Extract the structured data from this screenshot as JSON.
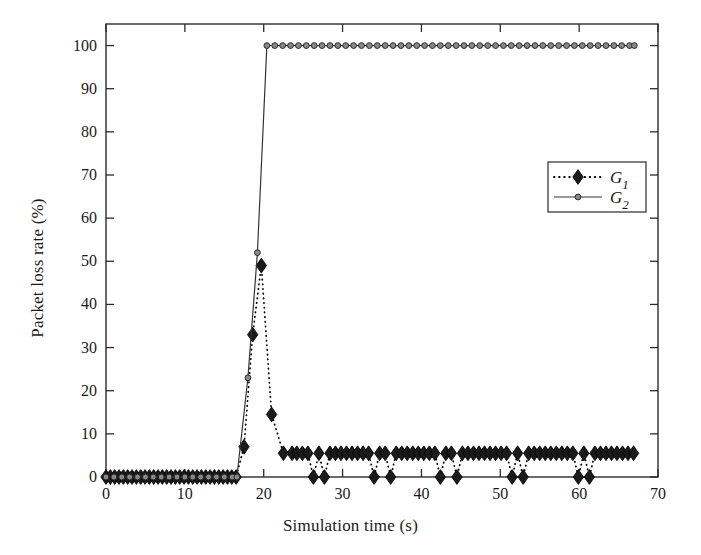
{
  "chart_data": {
    "type": "line",
    "title": "",
    "xlabel": "Simulation time (s)",
    "ylabel": "Packet loss rate (%)",
    "xlim": [
      0,
      70
    ],
    "ylim": [
      0,
      105
    ],
    "xticks": [
      0,
      10,
      20,
      30,
      40,
      50,
      60,
      70
    ],
    "yticks": [
      0,
      10,
      20,
      30,
      40,
      50,
      60,
      70,
      80,
      90,
      100
    ],
    "xtick_labels": [
      "0",
      "10",
      "20",
      "30",
      "40",
      "50",
      "60",
      "70"
    ],
    "ytick_labels": [
      "0",
      "10",
      "20",
      "30",
      "40",
      "50",
      "60",
      "70",
      "80",
      "90",
      "100"
    ],
    "grid": false,
    "legend_position": "upper right",
    "series": [
      {
        "name": "G1",
        "label": "G",
        "subscript": "1",
        "color": "#000000",
        "linestyle": "dotted",
        "marker": "diamond",
        "marker_fill": "#1a1a1a",
        "x": [
          0,
          0.55,
          1.1,
          1.65,
          2.2,
          2.75,
          3.3,
          3.85,
          4.4,
          4.95,
          5.5,
          6.05,
          6.6,
          7.15,
          7.7,
          8.25,
          8.8,
          9.35,
          9.9,
          10.45,
          11,
          11.55,
          12.1,
          12.65,
          13.2,
          13.75,
          14.3,
          14.85,
          15.4,
          15.95,
          16.5,
          17.5,
          18.6,
          19.7,
          21.0,
          22.5,
          23.6,
          24.2,
          24.9,
          25.6,
          26.3,
          27.0,
          27.7,
          28.4,
          29.1,
          29.8,
          30.5,
          31.2,
          31.9,
          32.6,
          33.3,
          34.0,
          34.7,
          35.4,
          36.1,
          36.8,
          37.5,
          38.2,
          38.9,
          39.6,
          40.3,
          41.0,
          41.7,
          42.4,
          43.1,
          43.8,
          44.5,
          45.2,
          45.9,
          46.6,
          47.3,
          48.0,
          48.7,
          49.4,
          50.1,
          50.8,
          51.5,
          52.2,
          52.9,
          53.6,
          54.3,
          55.0,
          55.7,
          56.4,
          57.1,
          57.8,
          58.5,
          59.2,
          59.9,
          60.6,
          61.3,
          62.0,
          62.7,
          63.4,
          64.1,
          64.8,
          65.5,
          66.2,
          66.9
        ],
        "y": [
          0,
          0,
          0,
          0,
          0,
          0,
          0,
          0,
          0,
          0,
          0,
          0,
          0,
          0,
          0,
          0,
          0,
          0,
          0,
          0,
          0,
          0,
          0,
          0,
          0,
          0,
          0,
          0,
          0,
          0,
          0,
          7,
          33,
          49,
          14.5,
          5.5,
          5.5,
          5.5,
          5.5,
          5.5,
          0,
          5.5,
          0,
          5.5,
          5.5,
          5.5,
          5.5,
          5.5,
          5.5,
          5.5,
          5.5,
          0,
          5.5,
          5.5,
          0,
          5.5,
          5.5,
          5.5,
          5.5,
          5.5,
          5.5,
          5.5,
          5.5,
          0,
          5.5,
          5.5,
          0,
          5.5,
          5.5,
          5.5,
          5.5,
          5.5,
          5.5,
          5.5,
          5.5,
          5.5,
          0,
          5.5,
          0,
          5.5,
          5.5,
          5.5,
          5.5,
          5.5,
          5.5,
          5.5,
          5.5,
          5.5,
          0,
          5.5,
          0,
          5.5,
          5.5,
          5.5,
          5.5,
          5.5,
          5.5,
          5.5,
          5.5
        ]
      },
      {
        "name": "G2",
        "label": "G",
        "subscript": "2",
        "color": "#333333",
        "linestyle": "solid",
        "marker": "circle",
        "marker_fill": "#888888",
        "x": [
          0,
          1,
          2,
          3,
          4,
          5,
          6,
          7,
          8,
          9,
          10,
          11,
          12,
          13,
          14,
          15,
          16,
          16.6,
          18.0,
          19.2,
          20.4,
          21.4,
          22.4,
          23.4,
          24.4,
          25.4,
          26.4,
          27.4,
          28.4,
          29.4,
          30.4,
          31.4,
          32.4,
          33.4,
          34.4,
          35.4,
          36.4,
          37.4,
          38.4,
          39.4,
          40.4,
          41.4,
          42.4,
          43.4,
          44.4,
          45.4,
          46.4,
          47.4,
          48.4,
          49.4,
          50.4,
          51.4,
          52.4,
          53.4,
          54.4,
          55.4,
          56.4,
          57.4,
          58.4,
          59.4,
          60.4,
          61.4,
          62.4,
          63.4,
          64.4,
          65.4,
          66.4,
          67.0
        ],
        "y": [
          0,
          0,
          0,
          0,
          0,
          0,
          0,
          0,
          0,
          0,
          0,
          0,
          0,
          0,
          0,
          0,
          0,
          0,
          23,
          52,
          100,
          100,
          100,
          100,
          100,
          100,
          100,
          100,
          100,
          100,
          100,
          100,
          100,
          100,
          100,
          100,
          100,
          100,
          100,
          100,
          100,
          100,
          100,
          100,
          100,
          100,
          100,
          100,
          100,
          100,
          100,
          100,
          100,
          100,
          100,
          100,
          100,
          100,
          100,
          100,
          100,
          100,
          100,
          100,
          100,
          100,
          100,
          100
        ]
      }
    ],
    "legend": [
      {
        "label": "G",
        "subscript": "1"
      },
      {
        "label": "G",
        "subscript": "2"
      }
    ],
    "annotations": []
  },
  "colors": {
    "axis": "#2b2b2b",
    "background": "#ffffff",
    "g1": "#000000",
    "g2": "#333333"
  }
}
